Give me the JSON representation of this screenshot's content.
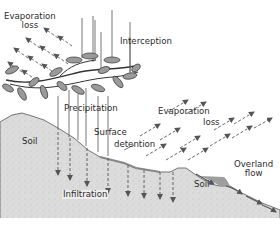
{
  "diagram": {
    "colors": {
      "soil_fill": "#d9d9d9",
      "soil_edge": "#555555",
      "arrow": "#555555",
      "leaf_fill": "#9a9a9a",
      "ponded_water": "#9e9e9e",
      "text": "#2b2b2b"
    },
    "labels": {
      "evaporation_loss_upper_1": "Evaporation",
      "evaporation_loss_upper_2": "loss",
      "interception": "Interception",
      "precipitation": "Precipitation",
      "evaporation_loss_lower_1": "Evaporation",
      "evaporation_loss_lower_2": "loss",
      "surface_detention_1": "Surface",
      "surface_detention_2": "detention",
      "soil_left": "Soil",
      "soil_right": "Soil",
      "overland_flow_1": "Overland",
      "overland_flow_2": "flow",
      "infiltration": "Infiltration"
    },
    "nodes": [
      {
        "id": "precipitation",
        "label": "Precipitation"
      },
      {
        "id": "interception",
        "label": "Interception"
      },
      {
        "id": "evaporation-upper",
        "label": "Evaporation loss"
      },
      {
        "id": "surface-detention",
        "label": "Surface detention"
      },
      {
        "id": "evaporation-lower",
        "label": "Evaporation loss"
      },
      {
        "id": "infiltration",
        "label": "Infiltration"
      },
      {
        "id": "overland-flow",
        "label": "Overland flow"
      },
      {
        "id": "soil",
        "label": "Soil"
      }
    ],
    "edges": [
      {
        "from": "precipitation",
        "to": "interception"
      },
      {
        "from": "interception",
        "to": "evaporation-upper"
      },
      {
        "from": "precipitation",
        "to": "surface-detention"
      },
      {
        "from": "surface-detention",
        "to": "evaporation-lower"
      },
      {
        "from": "surface-detention",
        "to": "infiltration"
      },
      {
        "from": "surface-detention",
        "to": "overland-flow"
      }
    ]
  }
}
